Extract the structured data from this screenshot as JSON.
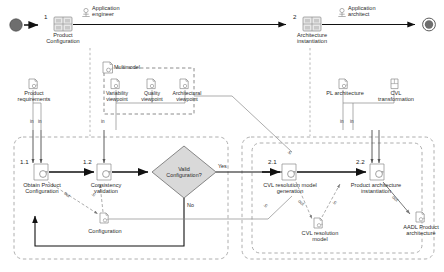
{
  "diagram": {
    "type": "activity-diagram",
    "colors": {
      "stroke": "#808080",
      "flow": "#111111",
      "fill_shape": "#d9d9d9",
      "text": "#2b2b2b",
      "dashed": "#9a9a9a"
    }
  },
  "top_lane": {
    "start_node": "start-node",
    "end_node": "end-node",
    "activities": [
      {
        "number": "1",
        "label": "Product\nConfiguration",
        "icon": "activity-group-icon"
      },
      {
        "number": "2",
        "label": "Architecture\ninstantiation",
        "icon": "activity-group-icon"
      }
    ],
    "roles": [
      {
        "label": "Application\nengineer",
        "icon": "actor-icon"
      },
      {
        "label": "Application\narchitect",
        "icon": "actor-icon"
      }
    ]
  },
  "artifacts_top": [
    {
      "name": "product-requirements",
      "label": "Product\nrequirements",
      "icon": "document-icon"
    },
    {
      "name": "pl-architecture",
      "label": "PL architecture",
      "icon": "document-icon"
    },
    {
      "name": "cvl-transformation",
      "label": "CVL\ntransformation",
      "icon": "transformation-icon"
    }
  ],
  "multimodel": {
    "label": "Multimodel",
    "icon": "document-icon",
    "viewpoints": [
      {
        "name": "variability-viewpoint",
        "label": "Variability\nviewpoint",
        "icon": "document-icon"
      },
      {
        "name": "quality-viewpoint",
        "label": "Quality\nviewpoint",
        "icon": "document-icon"
      },
      {
        "name": "architectural-viewpoint",
        "label": "Architectural\nviewpoint",
        "icon": "document-icon"
      }
    ]
  },
  "lane_left": {
    "name": "product-configuration-lane",
    "steps": [
      {
        "number": "1.1",
        "label": "Obtain Product\nConfiguration",
        "icon": "action-icon"
      },
      {
        "number": "1.2",
        "label": "Consistency\nvalidation",
        "icon": "action-icon"
      }
    ],
    "decision": {
      "label": "Valid\nConfiguration?",
      "yes": "Yes",
      "no": "No"
    },
    "artifacts": [
      {
        "name": "configuration-artifact",
        "label": "Configuration",
        "icon": "document-icon"
      }
    ]
  },
  "lane_right": {
    "name": "architecture-instantiation-lane",
    "steps": [
      {
        "number": "2.1",
        "label": "CVL resolution model\ngeneration",
        "icon": "action-icon"
      },
      {
        "number": "2.2",
        "label": "Product architecture\ninstantiation",
        "icon": "action-icon"
      }
    ],
    "artifacts": [
      {
        "name": "cvl-resolution-model",
        "label": "CVL resolution\nmodel",
        "icon": "document-icon"
      },
      {
        "name": "aadl-product-architecture",
        "label": "AADL Product\narchitecture",
        "icon": "document-icon"
      }
    ]
  },
  "edge_labels": {
    "in": "in",
    "out": "out",
    "yes": "Yes",
    "no": "No"
  },
  "pin_labels": [
    {
      "id": "p1",
      "text": "in"
    },
    {
      "id": "p2",
      "text": "in"
    },
    {
      "id": "p3",
      "text": "in"
    },
    {
      "id": "p4",
      "text": "in"
    },
    {
      "id": "p5",
      "text": "in"
    },
    {
      "id": "p6",
      "text": "out"
    },
    {
      "id": "p7",
      "text": "in"
    },
    {
      "id": "p8",
      "text": "in"
    },
    {
      "id": "p9",
      "text": "in"
    },
    {
      "id": "p10",
      "text": "out"
    },
    {
      "id": "p11",
      "text": "in"
    },
    {
      "id": "p12",
      "text": "out"
    }
  ]
}
